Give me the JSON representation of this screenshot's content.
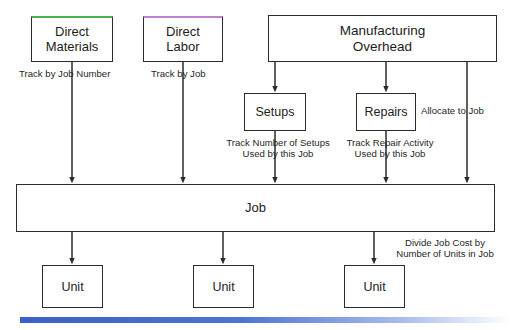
{
  "diagram": {
    "nodes": {
      "direct_materials": {
        "label": "Direct\nMaterials",
        "accent_color": "#4cb04c"
      },
      "direct_labor": {
        "label": "Direct\nLabor",
        "accent_color": "#c37fd0"
      },
      "manufacturing_overhead": {
        "label": "Manufacturing\nOverhead"
      },
      "setups": {
        "label": "Setups"
      },
      "repairs": {
        "label": "Repairs"
      },
      "job": {
        "label": "Job"
      },
      "unit_1": {
        "label": "Unit"
      },
      "unit_2": {
        "label": "Unit"
      },
      "unit_3": {
        "label": "Unit"
      }
    },
    "edge_labels": {
      "track_by_job_number": "Track by Job Number",
      "track_by_job": "Track by Job",
      "track_number_of_setups": "Track Number of Setups\nUsed by this Job",
      "track_repair_activity": "Track Repair Activity\nUsed by this Job",
      "allocate_to_job": "Allocate to Job",
      "divide_job_cost": "Divide Job Cost by\nNumber of Units in Job"
    },
    "colors": {
      "line": "#2b2b2b",
      "text": "#1c1c1c",
      "bar_start": "#3a5fc8",
      "bar_end": "#ffffff"
    }
  }
}
